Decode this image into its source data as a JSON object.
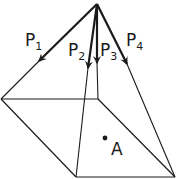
{
  "figure": {
    "type": "pyramid-force-diagram",
    "colors": {
      "stroke": "#1a1a1a",
      "background": "#ffffff"
    },
    "apex": [
      97,
      4
    ],
    "base": {
      "left": [
        1,
        99
      ],
      "inner": [
        98,
        99
      ],
      "bottom_left": [
        76,
        177
      ],
      "bottom_right": [
        175,
        177
      ]
    },
    "forces": [
      {
        "id": "P1",
        "letter": "P",
        "subscript": "1"
      },
      {
        "id": "P2",
        "letter": "P",
        "subscript": "2"
      },
      {
        "id": "P3",
        "letter": "P",
        "subscript": "3"
      },
      {
        "id": "P4",
        "letter": "P",
        "subscript": "4"
      }
    ],
    "point": {
      "label": "A"
    }
  }
}
